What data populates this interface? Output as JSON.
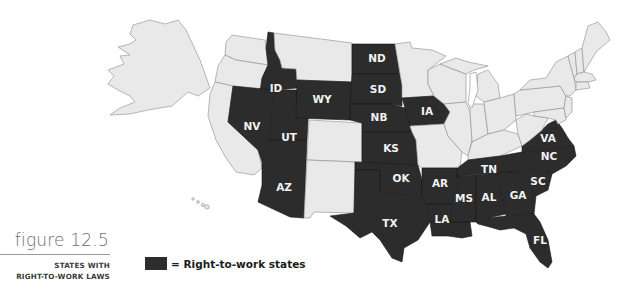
{
  "figure": {
    "title": "figure 12.5",
    "subtitle_line1": "STATES WITH",
    "subtitle_line2": "RIGHT-TO-WORK LAWS"
  },
  "legend": {
    "swatch_color": "#2c2c2c",
    "label": "= Right-to-work states"
  },
  "map": {
    "colors": {
      "right_to_work": "#2c2c2c",
      "other": "#e9e9e9",
      "border": "#9a9a9a",
      "label": "#f2f2f2"
    },
    "right_to_work_states": [
      "ID",
      "WY",
      "ND",
      "SD",
      "NB",
      "IA",
      "NV",
      "UT",
      "KS",
      "AZ",
      "OK",
      "TX",
      "AR",
      "LA",
      "MS",
      "AL",
      "TN",
      "GA",
      "SC",
      "NC",
      "VA",
      "FL"
    ],
    "labels": {
      "ID": "ID",
      "WY": "WY",
      "ND": "ND",
      "SD": "SD",
      "NB": "NB",
      "IA": "IA",
      "NV": "NV",
      "UT": "UT",
      "KS": "KS",
      "AZ": "AZ",
      "OK": "OK",
      "TX": "TX",
      "AR": "AR",
      "LA": "LA",
      "MS": "MS",
      "AL": "AL",
      "TN": "TN",
      "GA": "GA",
      "SC": "SC",
      "NC": "NC",
      "VA": "VA",
      "FL": "FL"
    }
  }
}
